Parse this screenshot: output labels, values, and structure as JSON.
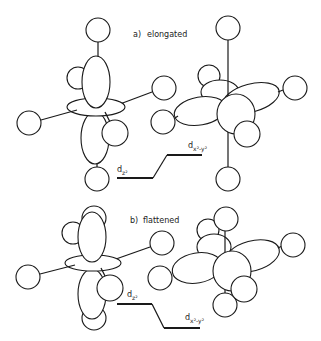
{
  "panels": [
    {
      "id": "a",
      "label": "a)",
      "title": "elongated",
      "orbitals": [
        "dz2",
        "dx2-y2"
      ],
      "energy_levels": {
        "lower": {
          "name": "d",
          "sub": "z²"
        },
        "upper": {
          "name": "d",
          "sub": "x²-y²"
        }
      }
    },
    {
      "id": "b",
      "label": "b)",
      "title": "flattened",
      "orbitals": [
        "dz2",
        "dx2-y2"
      ],
      "energy_levels": {
        "upper": {
          "name": "d",
          "sub": "z²"
        },
        "lower": {
          "name": "d",
          "sub": "x²-y²"
        }
      }
    }
  ],
  "colors": {
    "line": "#1a1a1a",
    "background": "#ffffff"
  }
}
